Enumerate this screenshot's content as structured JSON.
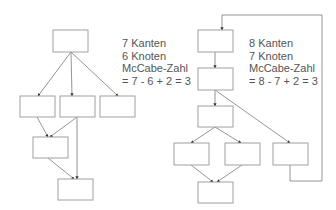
{
  "colors": {
    "box_stroke": "#a0a0a0",
    "edge_stroke": "#7a7a7a",
    "arrowhead": "#333333",
    "text": "#555555",
    "background": "#ffffff"
  },
  "left_graph": {
    "title_lines": [
      "7 Kanten",
      "6 Knoten",
      "McCabe-Zahl",
      "= 7 - 6 + 2 = 3"
    ],
    "edges_count": 7,
    "nodes_count": 6,
    "mccabe": 3,
    "nodes": [
      {
        "id": "L1",
        "x": 53,
        "y": 30,
        "w": 35,
        "h": 22
      },
      {
        "id": "L2",
        "x": 20,
        "y": 96,
        "w": 35,
        "h": 21
      },
      {
        "id": "L3",
        "x": 60,
        "y": 96,
        "w": 35,
        "h": 21
      },
      {
        "id": "L4",
        "x": 100,
        "y": 96,
        "w": 35,
        "h": 21
      },
      {
        "id": "L5",
        "x": 33,
        "y": 137,
        "w": 35,
        "h": 21
      },
      {
        "id": "L6",
        "x": 58,
        "y": 179,
        "w": 35,
        "h": 21
      }
    ]
  },
  "right_graph": {
    "title_lines": [
      "8 Kanten",
      "7 Knoten",
      "McCabe-Zahl",
      "= 8 - 7 + 2 = 3"
    ],
    "edges_count": 8,
    "nodes_count": 7,
    "mccabe": 3,
    "nodes": [
      {
        "id": "R1",
        "x": 198,
        "y": 30,
        "w": 35,
        "h": 22
      },
      {
        "id": "R2",
        "x": 198,
        "y": 68,
        "w": 35,
        "h": 22
      },
      {
        "id": "R3",
        "x": 198,
        "y": 106,
        "w": 35,
        "h": 21
      },
      {
        "id": "R4",
        "x": 174,
        "y": 143,
        "w": 35,
        "h": 22
      },
      {
        "id": "R5",
        "x": 225,
        "y": 143,
        "w": 35,
        "h": 22
      },
      {
        "id": "R6",
        "x": 273,
        "y": 143,
        "w": 35,
        "h": 22
      },
      {
        "id": "R7",
        "x": 198,
        "y": 182,
        "w": 35,
        "h": 21
      }
    ]
  }
}
